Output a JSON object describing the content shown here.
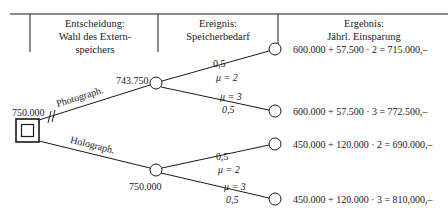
{
  "header": {
    "columns": [
      {
        "lines": [
          "Entscheidung:",
          "Wahl des Extern-",
          "speichers"
        ]
      },
      {
        "lines": [
          "Ereignis:",
          "Speicherbedarf"
        ]
      },
      {
        "lines": [
          "Ergebnis:",
          "Jährl. Einsparung"
        ]
      }
    ]
  },
  "tree": {
    "decision_node": {
      "value": "750.000"
    },
    "branches": [
      {
        "label": "Photograph.",
        "pruned_marker": "//",
        "chance_node_value": "743.750",
        "outcomes": [
          {
            "probability": "0,5",
            "mu": "μ = 2",
            "result": "600.000 +  57.500 · 2 = 715.000,–"
          },
          {
            "probability": "0,5",
            "mu": "μ = 3",
            "result": "600.000 +  57.500 · 3 = 772.500,–"
          }
        ]
      },
      {
        "label": "Holograph.",
        "chance_node_value": "750.000",
        "outcomes": [
          {
            "probability": "0,5",
            "mu": "μ = 2",
            "result": "450.000 + 120.000 · 2 = 690.000,–"
          },
          {
            "probability": "0,5",
            "mu": "μ = 3",
            "result": "450.000 + 120.000 · 3 = 810,000,–"
          }
        ]
      }
    ]
  },
  "colors": {
    "ink": "#1a1a1a",
    "background": "#ffffff"
  }
}
